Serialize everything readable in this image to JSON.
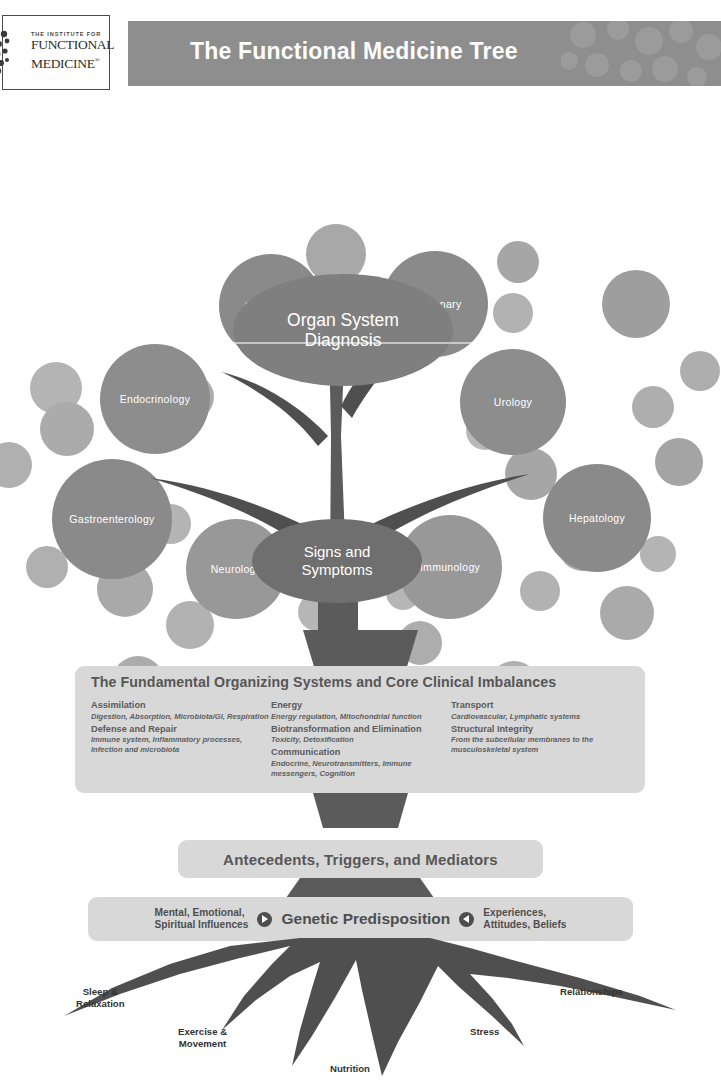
{
  "header": {
    "logo": {
      "line1": "THE INSTITUTE FOR",
      "line2": "FUNCTIONAL",
      "line3": "MEDICINE",
      "registered_mark": "®"
    },
    "title": "The Functional Medicine Tree"
  },
  "canopy": {
    "organ_system_node": {
      "line1": "Organ System",
      "line2": "Diagnosis"
    },
    "signs_symptoms_node": {
      "line1": "Signs and",
      "line2": "Symptoms"
    },
    "specialties": [
      {
        "label": "Cardiology",
        "x": 219,
        "y": 148,
        "d": 104,
        "color": "#8a8a8a"
      },
      {
        "label": "Pulmonary",
        "x": 382,
        "y": 145,
        "d": 106,
        "color": "#8a8a8a"
      },
      {
        "label": "Endocrinology",
        "x": 100,
        "y": 238,
        "d": 110,
        "color": "#8d8d8d"
      },
      {
        "label": "Urology",
        "x": 460,
        "y": 243,
        "d": 106,
        "color": "#8d8d8d"
      },
      {
        "label": "Gastroenterology",
        "x": 52,
        "y": 353,
        "d": 120,
        "color": "#8a8a8a"
      },
      {
        "label": "Hepatology",
        "x": 543,
        "y": 358,
        "d": 108,
        "color": "#8a8a8a"
      },
      {
        "label": "Neurology",
        "x": 186,
        "y": 413,
        "d": 100,
        "color": "#989898"
      },
      {
        "label": "Immunology",
        "x": 398,
        "y": 409,
        "d": 104,
        "color": "#989898"
      }
    ],
    "decor_bubbles": [
      {
        "x": 306,
        "y": 118,
        "d": 60,
        "color": "#a8a8a8"
      },
      {
        "x": 330,
        "y": 196,
        "d": 42,
        "color": "#b5b5b5"
      },
      {
        "x": 343,
        "y": 240,
        "d": 40,
        "color": "#b0b0b0"
      },
      {
        "x": 497,
        "y": 135,
        "d": 42,
        "color": "#a6a6a6"
      },
      {
        "x": 493,
        "y": 187,
        "d": 40,
        "color": "#b2b2b2"
      },
      {
        "x": 602,
        "y": 164,
        "d": 68,
        "color": "#9e9e9e"
      },
      {
        "x": 30,
        "y": 256,
        "d": 52,
        "color": "#b4b4b4"
      },
      {
        "x": 40,
        "y": 296,
        "d": 54,
        "color": "#ababab"
      },
      {
        "x": -14,
        "y": 336,
        "d": 46,
        "color": "#b0b0b0"
      },
      {
        "x": 466,
        "y": 306,
        "d": 38,
        "color": "#b8b8b8"
      },
      {
        "x": 505,
        "y": 342,
        "d": 52,
        "color": "#a6a6a6"
      },
      {
        "x": 632,
        "y": 280,
        "d": 42,
        "color": "#aeaeae"
      },
      {
        "x": 655,
        "y": 332,
        "d": 48,
        "color": "#a4a4a4"
      },
      {
        "x": 168,
        "y": 268,
        "d": 46,
        "color": "#adadad"
      },
      {
        "x": 151,
        "y": 398,
        "d": 40,
        "color": "#b4b4b4"
      },
      {
        "x": 26,
        "y": 440,
        "d": 42,
        "color": "#b0b0b0"
      },
      {
        "x": 97,
        "y": 455,
        "d": 56,
        "color": "#a9a9a9"
      },
      {
        "x": 166,
        "y": 495,
        "d": 48,
        "color": "#b2b2b2"
      },
      {
        "x": 112,
        "y": 550,
        "d": 52,
        "color": "#acacac"
      },
      {
        "x": 298,
        "y": 487,
        "d": 38,
        "color": "#b6b6b6"
      },
      {
        "x": 386,
        "y": 470,
        "d": 34,
        "color": "#b6b6b6"
      },
      {
        "x": 398,
        "y": 515,
        "d": 44,
        "color": "#adadad"
      },
      {
        "x": 520,
        "y": 465,
        "d": 40,
        "color": "#b2b2b2"
      },
      {
        "x": 558,
        "y": 415,
        "d": 50,
        "color": "#a7a7a7"
      },
      {
        "x": 600,
        "y": 480,
        "d": 54,
        "color": "#aaaaaa"
      },
      {
        "x": 640,
        "y": 430,
        "d": 36,
        "color": "#b4b4b4"
      },
      {
        "x": 680,
        "y": 245,
        "d": 40,
        "color": "#aeaeae"
      },
      {
        "x": 488,
        "y": 555,
        "d": 52,
        "color": "#b0b0b0"
      },
      {
        "x": 248,
        "y": 140,
        "d": 0,
        "color": "#b0b0b0"
      }
    ]
  },
  "fundamental": {
    "title": "The Fundamental Organizing Systems and Core Clinical Imbalances",
    "columns": [
      {
        "groups": [
          {
            "title": "Assimilation",
            "desc": "Digestion, Absorption, Microbiota/GI, Respiration"
          },
          {
            "title": "Defense and Repair",
            "desc": "Immune system, Inflammatory processes, Infection and microbiota"
          }
        ]
      },
      {
        "groups": [
          {
            "title": "Energy",
            "desc": "Energy regulation, Mitochondrial function"
          },
          {
            "title": "Biotransformation and Elimination",
            "desc": "Toxicity, Detoxification"
          },
          {
            "title": "Communication",
            "desc": "Endocrine, Neurotransmitters, Immune messengers, Cognition"
          }
        ]
      },
      {
        "groups": [
          {
            "title": "Transport",
            "desc": "Cardiovascular, Lymphatic systems"
          },
          {
            "title": "Structural Integrity",
            "desc": "From the subcellular membranes to the musculoskeletal system"
          }
        ]
      }
    ]
  },
  "antecedents": {
    "label": "Antecedents, Triggers, and Mediators"
  },
  "genetic": {
    "left_label_line1": "Mental, Emotional,",
    "left_label_line2": "Spiritual Influences",
    "left_arrow": "arrow-right-icon",
    "center_label": "Genetic Predisposition",
    "right_arrow": "arrow-left-icon",
    "right_label_line1": "Experiences,",
    "right_label_line2": "Attitudes, Beliefs"
  },
  "roots": [
    {
      "id": "sleep",
      "line1": "Sleep &",
      "line2": "Relaxation",
      "x": 76,
      "y": 48
    },
    {
      "id": "exercise",
      "line1": "Exercise &",
      "line2": "Movement",
      "x": 178,
      "y": 88
    },
    {
      "id": "nutrition",
      "line1": "Nutrition",
      "line2": "",
      "x": 330,
      "y": 125
    },
    {
      "id": "stress",
      "line1": "Stress",
      "line2": "",
      "x": 470,
      "y": 88
    },
    {
      "id": "relationships",
      "line1": "Relationships",
      "line2": "",
      "x": 560,
      "y": 48
    }
  ],
  "colors": {
    "banner": "#8e8e8e",
    "panel": "#d8d8d8",
    "trunk": "#5b5b5b",
    "node": "#7f7f7f",
    "text_dark": "#4e4e4e"
  }
}
